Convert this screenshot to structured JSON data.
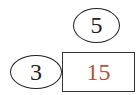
{
  "diagram": {
    "top_node": {
      "label": "5"
    },
    "left_node": {
      "label": "3"
    },
    "product_box": {
      "label": "15",
      "color": "#b5533c"
    }
  }
}
